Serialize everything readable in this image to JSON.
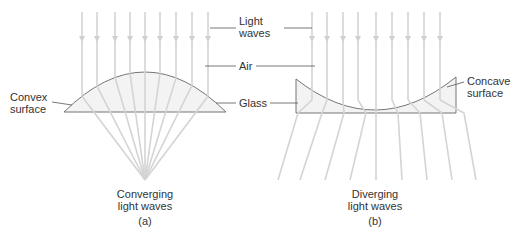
{
  "labels": {
    "light_waves_1": "Light",
    "light_waves_2": "waves",
    "air": "Air",
    "glass": "Glass",
    "convex_1": "Convex",
    "convex_2": "surface",
    "concave_1": "Concave",
    "concave_2": "surface",
    "converging_1": "Converging",
    "converging_2": "light waves",
    "caption_a": "(a)",
    "diverging_1": "Diverging",
    "diverging_2": "light waves",
    "caption_b": "(b)"
  },
  "colors": {
    "ray": "#d4d4d4",
    "lens_stroke": "#666666",
    "lens_fill": "#f3f3f3",
    "leader": "#555555",
    "text": "#333333"
  },
  "panel_a": {
    "name": "Convex lens - converging",
    "ray_x": [
      82,
      97,
      115,
      130,
      145,
      160,
      176,
      192,
      208
    ],
    "focal_point": [
      145,
      180
    ]
  },
  "panel_b": {
    "name": "Concave lens - diverging",
    "ray_x": [
      312,
      327,
      343,
      358,
      376,
      392,
      408,
      424,
      440
    ],
    "exit_x": [
      298,
      322,
      344,
      366,
      376,
      398,
      420,
      442,
      464
    ],
    "end_x": [
      278,
      300,
      325,
      350,
      376,
      402,
      427,
      452,
      476
    ]
  }
}
